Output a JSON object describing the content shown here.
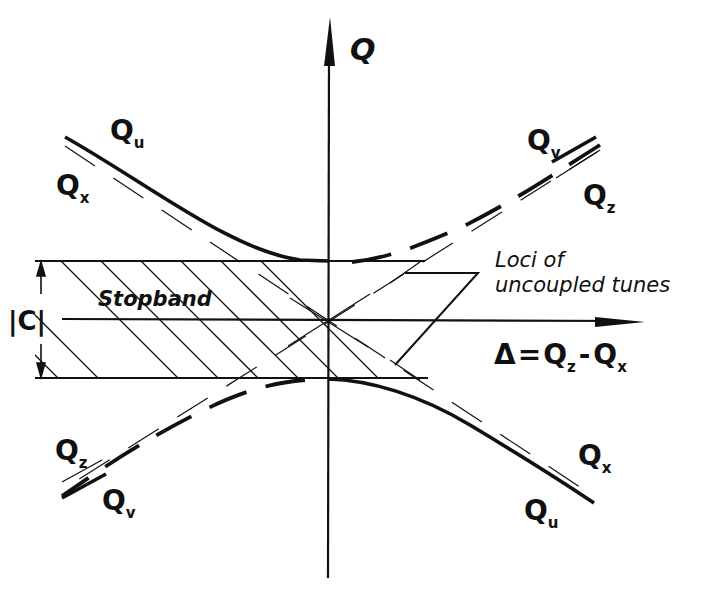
{
  "diagram": {
    "axes": {
      "vertical_label": "Q",
      "horizontal_label": {
        "delta": "Δ",
        "equals": "=",
        "term1": "Q",
        "term1_sub": "z",
        "minus": "-",
        "term2": "Q",
        "term2_sub": "x"
      }
    },
    "band": {
      "width_label": "|C|",
      "region_label": "Stopband"
    },
    "annotation": {
      "line1": "Loci of",
      "line2": "uncoupled tunes"
    },
    "curve_labels": {
      "top_left_solid": {
        "main": "Q",
        "sub": "u"
      },
      "top_left_dashed": {
        "main": "Q",
        "sub": "x"
      },
      "top_right_solid": {
        "main": "Q",
        "sub": "v"
      },
      "top_right_dashed": {
        "main": "Q",
        "sub": "z"
      },
      "bottom_left_dashed": {
        "main": "Q",
        "sub": "z"
      },
      "bottom_left_solid": {
        "main": "Q",
        "sub": "v"
      },
      "bottom_right_dashed": {
        "main": "Q",
        "sub": "x"
      },
      "bottom_right_solid": {
        "main": "Q",
        "sub": "u"
      }
    },
    "colors": {
      "ink": "#111111",
      "background": "#ffffff"
    }
  }
}
